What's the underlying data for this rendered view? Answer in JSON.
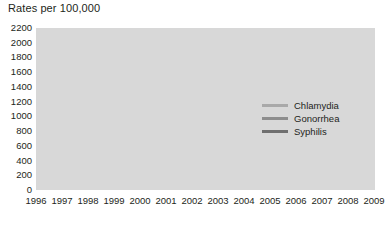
{
  "chart_data": {
    "type": "line",
    "title": "Rates per 100,000",
    "xlabel": "",
    "ylabel": "",
    "ylim": [
      0,
      2200
    ],
    "ytick_step": 200,
    "yticks": [
      2200,
      2000,
      1800,
      1600,
      1400,
      1200,
      1000,
      800,
      600,
      400,
      200,
      0
    ],
    "categories": [
      "1996",
      "1997",
      "1998",
      "1999",
      "2000",
      "2001",
      "2002",
      "2003",
      "2004",
      "2005",
      "2006",
      "2007",
      "2008",
      "2009"
    ],
    "grid": true,
    "legend_position": "inside-right",
    "series": [
      {
        "name": "Chlamydia",
        "color": "#a9a9a9",
        "values": [
          1100,
          1110,
          1250,
          1400,
          1380,
          1430,
          1480,
          1550,
          1620,
          1680,
          1780,
          1840,
          1950,
          2000
        ]
      },
      {
        "name": "Gonorrhea",
        "color": "#8d8d8d",
        "values": [
          510,
          500,
          530,
          525,
          500,
          480,
          465,
          440,
          405,
          425,
          430,
          430,
          425,
          390
        ]
      },
      {
        "name": "Syphilis",
        "color": "#6f6f6f",
        "values": [
          12,
          10,
          8,
          6,
          4,
          3,
          3,
          3,
          4,
          4,
          5,
          5,
          6,
          6
        ]
      }
    ]
  },
  "colors": {
    "plot_background": "#d8d8d8",
    "gridline": "#ffffff",
    "text": "#231f20",
    "page_background": "#ffffff"
  }
}
